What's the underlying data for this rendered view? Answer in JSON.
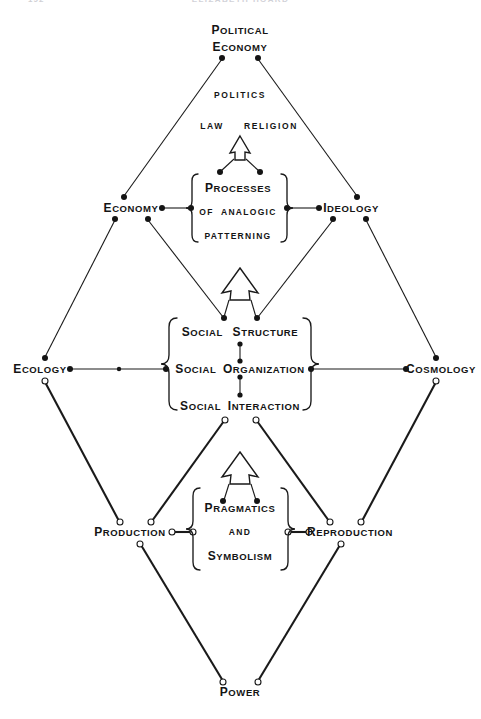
{
  "figure": {
    "type": "diagram",
    "diagram_kind": "double-diamond concept map",
    "header": {
      "page_number": "192",
      "running_title": "ELIZABETH HOARD"
    },
    "nodes": [
      {
        "id": "political-economy",
        "label_lines": [
          "Political",
          "Economy"
        ],
        "x": 240,
        "y": 45,
        "style": "small-caps",
        "role": "top-vertex"
      },
      {
        "id": "economy",
        "label_lines": [
          "Economy"
        ],
        "x": 131,
        "y": 208,
        "style": "small-caps",
        "role": "upper-left-vertex"
      },
      {
        "id": "ideology",
        "label_lines": [
          "Ideology"
        ],
        "x": 351,
        "y": 208,
        "style": "small-caps",
        "role": "upper-right-vertex"
      },
      {
        "id": "ecology",
        "label_lines": [
          "Ecology"
        ],
        "x": 40,
        "y": 369,
        "style": "small-caps",
        "role": "left-vertex"
      },
      {
        "id": "cosmology",
        "label_lines": [
          "Cosmology"
        ],
        "x": 441,
        "y": 369,
        "style": "small-caps",
        "role": "right-vertex"
      },
      {
        "id": "production",
        "label_lines": [
          "Production"
        ],
        "x": 130,
        "y": 532,
        "style": "small-caps",
        "role": "lower-left-vertex"
      },
      {
        "id": "reproduction",
        "label_lines": [
          "Reproduction"
        ],
        "x": 350,
        "y": 532,
        "style": "small-caps",
        "role": "lower-right-vertex"
      },
      {
        "id": "power",
        "label_lines": [
          "Power"
        ],
        "x": 240,
        "y": 692,
        "style": "small-caps",
        "role": "bottom-vertex"
      }
    ],
    "free_labels": [
      {
        "id": "politics",
        "text": "POLITICS",
        "x": 240,
        "y": 95,
        "style": "plain"
      },
      {
        "id": "law",
        "text": "LAW",
        "x": 212,
        "y": 126,
        "style": "plain"
      },
      {
        "id": "religion",
        "text": "RELIGION",
        "x": 271,
        "y": 126,
        "style": "plain"
      }
    ],
    "bracket_boxes": [
      {
        "id": "processes-box",
        "lines": [
          "Processes",
          "of  analogic",
          "patterning"
        ],
        "line_styles": [
          "small-caps",
          "plain",
          "plain"
        ],
        "cx": 238,
        "cy": 211,
        "half_w": 45,
        "half_h": 40
      },
      {
        "id": "social-box",
        "lines": [
          "Social   Structure",
          "Social  Organization",
          "Social  Interaction"
        ],
        "line_styles": [
          "small-caps",
          "small-caps",
          "small-caps"
        ],
        "cx": 240,
        "cy": 369,
        "half_w": 63,
        "half_h": 55
      },
      {
        "id": "pragmatics-box",
        "lines": [
          "Pragmatics",
          "and",
          "Symbolism"
        ],
        "line_styles": [
          "small-caps",
          "plain",
          "small-caps"
        ],
        "cx": 240,
        "cy": 532,
        "half_w": 45,
        "half_h": 48
      }
    ],
    "arrows": [
      {
        "id": "arrow-upper",
        "cx": 240,
        "cy": 152,
        "size": "small",
        "direction": "up",
        "feeds": "law-religion"
      },
      {
        "id": "arrow-middle",
        "cx": 240,
        "cy": 290,
        "size": "large",
        "direction": "up",
        "feeds": "processes-box"
      },
      {
        "id": "arrow-lower",
        "cx": 240,
        "cy": 474,
        "size": "large",
        "direction": "up",
        "feeds": "social-box"
      }
    ],
    "colors": {
      "ink": "#141414",
      "line": "#1a1a1a",
      "paper": "#ffffff",
      "header_ghost": "#d2d2d8"
    },
    "caption_terms": [
      "Political Economy",
      "Politics",
      "Law",
      "Religion",
      "Economy",
      "Ideology",
      "Processes of analogic patterning",
      "Ecology",
      "Cosmology",
      "Social Structure",
      "Social Organization",
      "Social Interaction",
      "Production",
      "Reproduction",
      "Pragmatics and Symbolism",
      "Power"
    ]
  }
}
